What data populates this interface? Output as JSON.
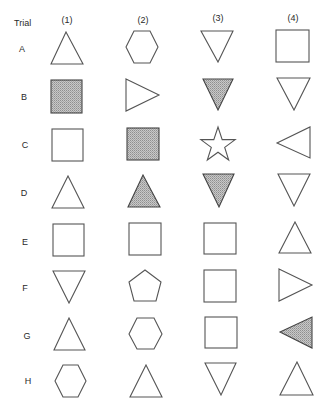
{
  "header": {
    "trial_label": "Trial",
    "columns": [
      "(1)",
      "(2)",
      "(3)",
      "(4)"
    ]
  },
  "colors": {
    "stroke": "#555555",
    "shade": "#b5b5b5",
    "background": "#ffffff"
  },
  "rows": [
    {
      "label": "A",
      "items": [
        {
          "shape": "triangle-up",
          "shaded": false
        },
        {
          "shape": "hexagon",
          "shaded": false
        },
        {
          "shape": "triangle-down",
          "shaded": false
        },
        {
          "shape": "square",
          "shaded": false
        }
      ]
    },
    {
      "label": "B",
      "items": [
        {
          "shape": "square",
          "shaded": true
        },
        {
          "shape": "triangle-right",
          "shaded": false
        },
        {
          "shape": "triangle-down",
          "shaded": true
        },
        {
          "shape": "triangle-down",
          "shaded": false
        }
      ]
    },
    {
      "label": "C",
      "items": [
        {
          "shape": "square",
          "shaded": false
        },
        {
          "shape": "square",
          "shaded": true
        },
        {
          "shape": "star",
          "shaded": false
        },
        {
          "shape": "triangle-left",
          "shaded": false
        }
      ]
    },
    {
      "label": "D",
      "items": [
        {
          "shape": "triangle-up",
          "shaded": false
        },
        {
          "shape": "triangle-up",
          "shaded": true
        },
        {
          "shape": "triangle-down",
          "shaded": true
        },
        {
          "shape": "triangle-down",
          "shaded": false
        }
      ]
    },
    {
      "label": "E",
      "items": [
        {
          "shape": "square",
          "shaded": false
        },
        {
          "shape": "square",
          "shaded": false
        },
        {
          "shape": "square",
          "shaded": false
        },
        {
          "shape": "triangle-up",
          "shaded": false
        }
      ]
    },
    {
      "label": "F",
      "items": [
        {
          "shape": "triangle-down",
          "shaded": false
        },
        {
          "shape": "pentagon",
          "shaded": false
        },
        {
          "shape": "square",
          "shaded": false
        },
        {
          "shape": "triangle-right",
          "shaded": false
        }
      ]
    },
    {
      "label": "G",
      "items": [
        {
          "shape": "triangle-up",
          "shaded": false
        },
        {
          "shape": "hexagon",
          "shaded": false
        },
        {
          "shape": "square",
          "shaded": false
        },
        {
          "shape": "triangle-left",
          "shaded": true
        }
      ]
    },
    {
      "label": "H",
      "items": [
        {
          "shape": "hexagon",
          "shaded": false
        },
        {
          "shape": "triangle-up",
          "shaded": false
        },
        {
          "shape": "triangle-down",
          "shaded": false
        },
        {
          "shape": "triangle-up",
          "shaded": false
        }
      ]
    }
  ]
}
